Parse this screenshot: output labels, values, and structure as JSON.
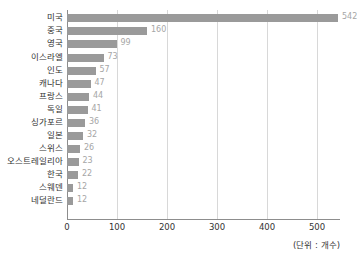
{
  "chart_data": {
    "type": "bar",
    "orientation": "horizontal",
    "title": "",
    "subtitle": "",
    "xlabel": "",
    "ylabel": "",
    "unit_note": "(단위 : 개수)",
    "categories": [
      "미국",
      "중국",
      "영국",
      "이스라엘",
      "인도",
      "캐나다",
      "프랑스",
      "독일",
      "싱가포르",
      "일본",
      "스위스",
      "오스트레일리아",
      "한국",
      "스웨덴",
      "네덜란드"
    ],
    "values": [
      542,
      160,
      99,
      73,
      57,
      47,
      44,
      41,
      36,
      32,
      26,
      23,
      22,
      12,
      12
    ],
    "value_labels": [
      "542",
      "160",
      "99",
      "73",
      "57",
      "47",
      "44",
      "41",
      "36",
      "32",
      "26",
      "23",
      "22",
      "12",
      "12"
    ],
    "xlim": [
      0,
      546
    ],
    "xticks": [
      0,
      100,
      200,
      300,
      400,
      500
    ],
    "xtick_labels": [
      "0",
      "100",
      "200",
      "300",
      "400",
      "500"
    ],
    "grid": true,
    "grid_axis": "x",
    "legend": false,
    "legend_position": "none",
    "colors": {
      "bar": "#9a9a9a",
      "value_label": "#a6a6a6",
      "category_label": "#333333",
      "tick_label": "#333333",
      "gridline": "#d8d8d8",
      "axis_line": "#8d8d8d",
      "background": "#ffffff"
    }
  }
}
